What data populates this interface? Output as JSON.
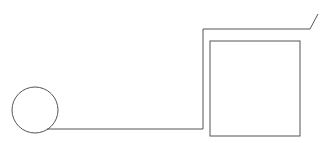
{
  "canvas": {
    "width": 325,
    "height": 143,
    "background": "#ffffff"
  },
  "stroke": {
    "color": "#555555",
    "width": 1
  },
  "shapes": {
    "circle": {
      "cx": 35,
      "cy": 110,
      "r": 23
    },
    "wire_path": "M 47 129 L 203 129 L 203 29 L 310 29 L 318 14",
    "square": {
      "x": 210,
      "y": 41,
      "width": 90,
      "height": 95
    }
  }
}
